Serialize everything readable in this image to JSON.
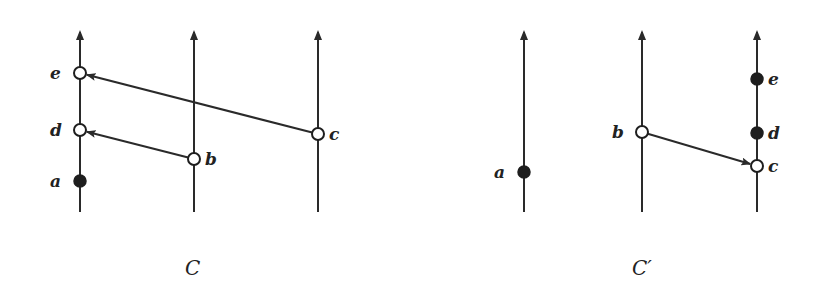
{
  "diagrams": [
    {
      "caption": "C",
      "caption_pos": [
        185,
        275
      ],
      "processes": [
        {
          "x": 80,
          "y_top": 30,
          "y_bottom": 212
        },
        {
          "x": 194,
          "y_top": 30,
          "y_bottom": 212
        },
        {
          "x": 318,
          "y_top": 30,
          "y_bottom": 212
        }
      ],
      "events": [
        {
          "label": "e",
          "x": 80,
          "y": 73,
          "kind": "open",
          "label_side": "left"
        },
        {
          "label": "d",
          "x": 80,
          "y": 130,
          "kind": "open",
          "label_side": "left"
        },
        {
          "label": "a",
          "x": 80,
          "y": 181,
          "kind": "filled",
          "label_side": "left"
        },
        {
          "label": "b",
          "x": 194,
          "y": 159,
          "kind": "open",
          "label_side": "right"
        },
        {
          "label": "c",
          "x": 318,
          "y": 134,
          "kind": "open",
          "label_side": "right"
        }
      ],
      "messages": [
        {
          "from": "c",
          "to": "e"
        },
        {
          "from": "b",
          "to": "d"
        }
      ]
    },
    {
      "caption": "C′",
      "caption_pos": [
        632,
        275
      ],
      "processes": [
        {
          "x": 524,
          "y_top": 30,
          "y_bottom": 212
        },
        {
          "x": 642,
          "y_top": 30,
          "y_bottom": 212
        },
        {
          "x": 757,
          "y_top": 30,
          "y_bottom": 212
        }
      ],
      "events": [
        {
          "label": "a",
          "x": 524,
          "y": 172,
          "kind": "filled",
          "label_side": "left"
        },
        {
          "label": "b",
          "x": 642,
          "y": 132,
          "kind": "open",
          "label_side": "left"
        },
        {
          "label": "e",
          "x": 757,
          "y": 79,
          "kind": "filled",
          "label_side": "right"
        },
        {
          "label": "d",
          "x": 757,
          "y": 133,
          "kind": "filled",
          "label_side": "right"
        },
        {
          "label": "c",
          "x": 757,
          "y": 166,
          "kind": "open",
          "label_side": "right"
        }
      ],
      "messages": [
        {
          "from": "b",
          "to": "c"
        }
      ]
    }
  ]
}
